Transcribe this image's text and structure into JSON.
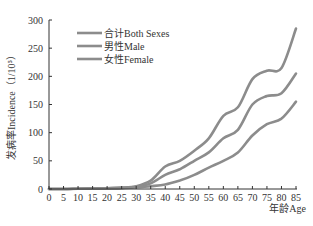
{
  "chart_data": {
    "type": "line",
    "title": "",
    "xlabel": "年龄Age",
    "ylabel": "发病率Incidence（1/10⁵）",
    "x": [
      0,
      5,
      10,
      15,
      20,
      25,
      30,
      35,
      40,
      45,
      50,
      55,
      60,
      65,
      70,
      75,
      80,
      85
    ],
    "xticks": [
      "0",
      "5",
      "10",
      "15",
      "20",
      "25",
      "30",
      "35",
      "40",
      "45",
      "50",
      "55",
      "60",
      "65",
      "70",
      "75",
      "80",
      "85"
    ],
    "yticks": [
      "0",
      "50",
      "100",
      "150",
      "200",
      "250",
      "300"
    ],
    "ylim": [
      0,
      300
    ],
    "xlim": [
      0,
      85
    ],
    "grid": false,
    "legend_position": "upper-left",
    "series": [
      {
        "name": "合计Both Sexes",
        "color": "#8c8c8c",
        "values": [
          0,
          0,
          0.5,
          1,
          1.5,
          2.5,
          5,
          15,
          40,
          50,
          68,
          90,
          130,
          145,
          195,
          210,
          215,
          285
        ]
      },
      {
        "name": "男性Male",
        "color": "#8c8c8c",
        "values": [
          0,
          0,
          0.5,
          1,
          1.5,
          2,
          4,
          10,
          25,
          35,
          50,
          65,
          90,
          105,
          150,
          165,
          170,
          205
        ]
      },
      {
        "name": "女性Female",
        "color": "#8c8c8c",
        "values": [
          0,
          0,
          0.3,
          0.5,
          1,
          1.5,
          3,
          5,
          8,
          15,
          25,
          38,
          50,
          65,
          95,
          115,
          125,
          155
        ]
      }
    ]
  }
}
